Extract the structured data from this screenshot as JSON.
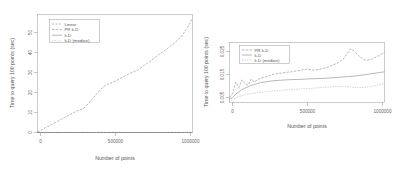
{
  "figure": {
    "panels": [
      {
        "id": "left-panel",
        "name": "linear-vs-kd-full-range",
        "xlabel": "Number of points",
        "ylabel": "Time to query 100 points (sec)",
        "xticks": [
          "0",
          "500000",
          "1000000"
        ],
        "yticks": [
          "0",
          "10",
          "20",
          "30",
          "40",
          "50"
        ],
        "legend": [
          "Linear",
          "PR k-D",
          "k-D",
          "k-D (median)"
        ]
      },
      {
        "id": "right-panel",
        "name": "kd-variants-zoomed",
        "xlabel": "Number of points",
        "ylabel": "Time to query 100 points (sec)",
        "xticks": [
          "0",
          "500000",
          "1000000"
        ],
        "yticks": [
          "0.005",
          "0.015",
          "0.025"
        ],
        "legend": [
          "PR k-D",
          "k-D",
          "k-D (median)"
        ]
      }
    ]
  },
  "chart_data": [
    {
      "type": "line",
      "id": "left-panel",
      "title": "",
      "xlabel": "Number of points",
      "ylabel": "Time to query 100 points (sec)",
      "xlim": [
        0,
        1000000
      ],
      "ylim": [
        0,
        58
      ],
      "xticks": [
        0,
        500000,
        1000000
      ],
      "yticks": [
        0,
        10,
        20,
        30,
        40,
        50
      ],
      "grid": false,
      "legend_position": "top-left",
      "x": [
        0,
        25000,
        50000,
        75000,
        100000,
        125000,
        150000,
        175000,
        200000,
        225000,
        250000,
        275000,
        300000,
        325000,
        350000,
        375000,
        400000,
        425000,
        450000,
        475000,
        500000,
        525000,
        550000,
        575000,
        600000,
        625000,
        650000,
        675000,
        700000,
        725000,
        750000,
        775000,
        800000,
        825000,
        850000,
        875000,
        900000,
        925000,
        950000,
        975000,
        1000000
      ],
      "series": [
        {
          "name": "Linear",
          "linestyle": "dashed",
          "values": [
            0.2,
            1.2,
            2.3,
            3.3,
            4.3,
            5.3,
            6.4,
            7.4,
            8.4,
            9.4,
            10.4,
            11.2,
            12.0,
            14.0,
            16.2,
            18.4,
            20.6,
            22.5,
            23.6,
            24.4,
            25.2,
            26.2,
            27.3,
            28.3,
            29.2,
            30.0,
            30.8,
            32.2,
            33.6,
            35.0,
            36.4,
            37.8,
            39.2,
            40.6,
            42.0,
            43.4,
            45.0,
            47.0,
            49.6,
            52.6,
            56.2
          ]
        },
        {
          "name": "PR k-D",
          "linestyle": "dashed",
          "values": [
            0.02,
            0.02,
            0.02,
            0.02,
            0.02,
            0.02,
            0.02,
            0.02,
            0.02,
            0.02,
            0.02,
            0.02,
            0.02,
            0.02,
            0.02,
            0.02,
            0.02,
            0.02,
            0.02,
            0.02,
            0.02,
            0.02,
            0.02,
            0.02,
            0.02,
            0.02,
            0.02,
            0.02,
            0.02,
            0.02,
            0.02,
            0.02,
            0.02,
            0.02,
            0.02,
            0.02,
            0.02,
            0.02,
            0.02,
            0.02,
            0.02
          ]
        },
        {
          "name": "k-D",
          "linestyle": "solid",
          "values": [
            0.012,
            0.012,
            0.012,
            0.012,
            0.012,
            0.012,
            0.012,
            0.012,
            0.012,
            0.012,
            0.012,
            0.012,
            0.012,
            0.012,
            0.012,
            0.012,
            0.012,
            0.012,
            0.012,
            0.012,
            0.012,
            0.012,
            0.012,
            0.012,
            0.012,
            0.012,
            0.012,
            0.012,
            0.012,
            0.012,
            0.012,
            0.012,
            0.012,
            0.012,
            0.012,
            0.012,
            0.012,
            0.012,
            0.012,
            0.012,
            0.012
          ]
        },
        {
          "name": "k-D (median)",
          "linestyle": "dotted",
          "values": [
            0.008,
            0.008,
            0.008,
            0.008,
            0.008,
            0.008,
            0.008,
            0.008,
            0.008,
            0.008,
            0.008,
            0.008,
            0.008,
            0.008,
            0.008,
            0.008,
            0.008,
            0.008,
            0.008,
            0.008,
            0.008,
            0.008,
            0.008,
            0.008,
            0.008,
            0.008,
            0.008,
            0.008,
            0.008,
            0.008,
            0.008,
            0.008,
            0.008,
            0.008,
            0.008,
            0.008,
            0.008,
            0.008,
            0.008,
            0.008,
            0.008
          ]
        }
      ]
    },
    {
      "type": "line",
      "id": "right-panel",
      "title": "",
      "xlabel": "Number of points",
      "ylabel": "Time to query 100 points (sec)",
      "xlim": [
        0,
        1000000
      ],
      "ylim": [
        0.003,
        0.029
      ],
      "xticks": [
        0,
        500000,
        1000000
      ],
      "yticks": [
        0.005,
        0.015,
        0.025
      ],
      "grid": false,
      "legend_position": "top-left",
      "x": [
        0,
        20000,
        40000,
        60000,
        80000,
        100000,
        120000,
        140000,
        160000,
        180000,
        200000,
        240000,
        280000,
        320000,
        360000,
        400000,
        440000,
        480000,
        500000,
        540000,
        580000,
        620000,
        660000,
        700000,
        740000,
        780000,
        800000,
        840000,
        880000,
        920000,
        960000,
        1000000
      ],
      "series": [
        {
          "name": "PR k-D",
          "linestyle": "dashed",
          "values": [
            0.0052,
            0.0068,
            0.0118,
            0.0095,
            0.0128,
            0.0112,
            0.0105,
            0.0132,
            0.0118,
            0.0128,
            0.0135,
            0.0142,
            0.0152,
            0.0156,
            0.016,
            0.0163,
            0.0168,
            0.0172,
            0.0175,
            0.017,
            0.0174,
            0.018,
            0.019,
            0.0202,
            0.0222,
            0.0262,
            0.0255,
            0.0228,
            0.0212,
            0.0218,
            0.0232,
            0.0248
          ]
        },
        {
          "name": "k-D",
          "linestyle": "solid",
          "values": [
            0.0045,
            0.0052,
            0.0066,
            0.0076,
            0.0086,
            0.0092,
            0.0098,
            0.0104,
            0.0108,
            0.0112,
            0.0116,
            0.012,
            0.0124,
            0.0126,
            0.0128,
            0.0129,
            0.013,
            0.0131,
            0.0132,
            0.0133,
            0.0134,
            0.0135,
            0.0137,
            0.0139,
            0.0141,
            0.0143,
            0.0144,
            0.0147,
            0.0151,
            0.0155,
            0.0159,
            0.0163
          ]
        },
        {
          "name": "k-D (median)",
          "linestyle": "dotted",
          "values": [
            0.0038,
            0.0042,
            0.005,
            0.0056,
            0.006,
            0.0063,
            0.0066,
            0.0068,
            0.007,
            0.0072,
            0.0074,
            0.0077,
            0.008,
            0.0082,
            0.0084,
            0.0086,
            0.0088,
            0.009,
            0.009,
            0.0092,
            0.0094,
            0.0096,
            0.0098,
            0.01,
            0.0099,
            0.0097,
            0.0096,
            0.0094,
            0.0096,
            0.01,
            0.0106,
            0.0114
          ]
        }
      ]
    }
  ]
}
